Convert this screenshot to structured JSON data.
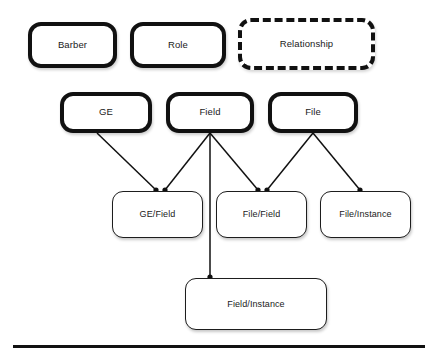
{
  "diagram": {
    "background_color": "#ffffff",
    "line_color": "#111111",
    "text_color": "#1a1a1a",
    "nodes": [
      {
        "id": "barber",
        "label": "Barber",
        "style": "heavy",
        "x": 28,
        "y": 22,
        "w": 89,
        "h": 46
      },
      {
        "id": "role",
        "label": "Role",
        "style": "heavy",
        "x": 130,
        "y": 22,
        "w": 96,
        "h": 46
      },
      {
        "id": "relationship",
        "label": "Relationship",
        "style": "dashed",
        "x": 238,
        "y": 18,
        "w": 137,
        "h": 52
      },
      {
        "id": "ge",
        "label": "GE",
        "style": "heavy",
        "x": 60,
        "y": 92,
        "w": 92,
        "h": 41
      },
      {
        "id": "field",
        "label": "Field",
        "style": "heavy",
        "x": 166,
        "y": 92,
        "w": 88,
        "h": 41
      },
      {
        "id": "file",
        "label": "File",
        "style": "heavy",
        "x": 268,
        "y": 92,
        "w": 90,
        "h": 41
      },
      {
        "id": "ge-field",
        "label": "GE/Field",
        "style": "light",
        "x": 112,
        "y": 191,
        "w": 91,
        "h": 47
      },
      {
        "id": "file-field",
        "label": "File/Field",
        "style": "light",
        "x": 216,
        "y": 191,
        "w": 91,
        "h": 47
      },
      {
        "id": "file-instance",
        "label": "File/Instance",
        "style": "light",
        "x": 320,
        "y": 191,
        "w": 91,
        "h": 47
      },
      {
        "id": "field-instance",
        "label": "Field/Instance",
        "style": "light",
        "x": 185,
        "y": 278,
        "w": 142,
        "h": 52
      }
    ],
    "edges": [
      {
        "id": "ge-to-ge-field",
        "from": "ge",
        "to": "ge-field",
        "x1": 97,
        "y1": 133,
        "x2": 156,
        "y2": 190
      },
      {
        "id": "field-to-ge-field",
        "from": "field",
        "to": "ge-field",
        "x1": 210,
        "y1": 133,
        "x2": 165,
        "y2": 190
      },
      {
        "id": "field-to-field-instance",
        "from": "field",
        "to": "field-instance",
        "x1": 210,
        "y1": 133,
        "x2": 210,
        "y2": 277
      },
      {
        "id": "field-to-file-field",
        "from": "field",
        "to": "file-field",
        "x1": 210,
        "y1": 133,
        "x2": 258,
        "y2": 190
      },
      {
        "id": "file-to-file-field",
        "from": "file",
        "to": "file-field",
        "x1": 313,
        "y1": 133,
        "x2": 267,
        "y2": 190
      },
      {
        "id": "file-to-file-instance",
        "from": "file",
        "to": "file-instance",
        "x1": 313,
        "y1": 133,
        "x2": 360,
        "y2": 190
      }
    ],
    "rule": {
      "id": "bottom-rule",
      "x": 13,
      "y": 345,
      "w": 412,
      "h": 3
    }
  }
}
